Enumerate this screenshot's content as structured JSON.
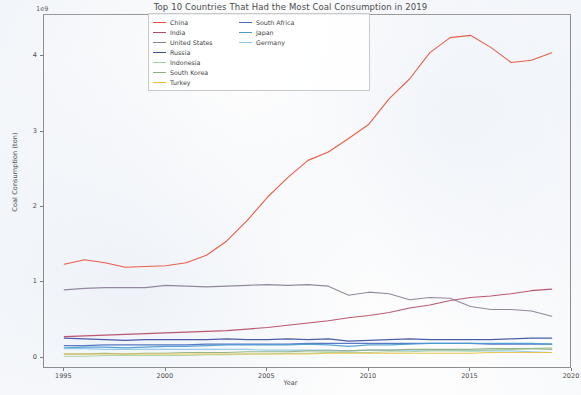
{
  "chart_data": {
    "type": "line",
    "title": "Top 10 Countries That Had the Most Coal Consumption in 2019",
    "xlabel": "Year",
    "ylabel": "Coal Consumption (ton)",
    "y_exponent_label": "1e9",
    "xlim": [
      1994,
      2020
    ],
    "ylim": [
      -0.15,
      4.55
    ],
    "xticks": [
      "1995",
      "2000",
      "2005",
      "2010",
      "2015",
      "2020"
    ],
    "xtick_values": [
      1995,
      2000,
      2005,
      2010,
      2015,
      2020
    ],
    "yticks": [
      "0",
      "1",
      "2",
      "3",
      "4"
    ],
    "ytick_values": [
      0,
      1,
      2,
      3,
      4
    ],
    "grid": false,
    "legend_position": "upper center",
    "x": [
      1995,
      1996,
      1997,
      1998,
      1999,
      2000,
      2001,
      2002,
      2003,
      2004,
      2005,
      2006,
      2007,
      2008,
      2009,
      2010,
      2011,
      2012,
      2013,
      2014,
      2015,
      2016,
      2017,
      2018,
      2019
    ],
    "series": [
      {
        "name": "China",
        "color": "#e8503a",
        "values": [
          1.24,
          1.3,
          1.26,
          1.2,
          1.21,
          1.22,
          1.26,
          1.36,
          1.55,
          1.82,
          2.13,
          2.39,
          2.62,
          2.73,
          2.91,
          3.1,
          3.44,
          3.7,
          4.05,
          4.25,
          4.28,
          4.12,
          3.92,
          3.95,
          4.05
        ]
      },
      {
        "name": "India",
        "color": "#b54a63",
        "values": [
          0.28,
          0.29,
          0.3,
          0.31,
          0.32,
          0.33,
          0.34,
          0.35,
          0.36,
          0.38,
          0.4,
          0.43,
          0.46,
          0.49,
          0.53,
          0.56,
          0.6,
          0.66,
          0.7,
          0.76,
          0.8,
          0.82,
          0.85,
          0.89,
          0.91
        ]
      },
      {
        "name": "United States",
        "color": "#8a7f96",
        "values": [
          0.9,
          0.92,
          0.93,
          0.93,
          0.93,
          0.96,
          0.95,
          0.94,
          0.95,
          0.96,
          0.97,
          0.96,
          0.97,
          0.95,
          0.83,
          0.87,
          0.85,
          0.77,
          0.8,
          0.79,
          0.68,
          0.64,
          0.64,
          0.62,
          0.55
        ]
      },
      {
        "name": "Russia",
        "color": "#3f4fa0",
        "values": [
          0.26,
          0.25,
          0.24,
          0.23,
          0.24,
          0.24,
          0.24,
          0.24,
          0.25,
          0.24,
          0.24,
          0.25,
          0.24,
          0.25,
          0.22,
          0.23,
          0.24,
          0.25,
          0.24,
          0.24,
          0.24,
          0.24,
          0.25,
          0.26,
          0.26
        ]
      },
      {
        "name": "South Africa",
        "color": "#4a6fc0",
        "values": [
          0.16,
          0.16,
          0.17,
          0.17,
          0.17,
          0.17,
          0.17,
          0.18,
          0.18,
          0.18,
          0.18,
          0.18,
          0.19,
          0.19,
          0.19,
          0.19,
          0.19,
          0.19,
          0.19,
          0.19,
          0.19,
          0.18,
          0.18,
          0.18,
          0.18
        ]
      },
      {
        "name": "Japan",
        "color": "#4a9bd4",
        "values": [
          0.13,
          0.14,
          0.14,
          0.13,
          0.14,
          0.15,
          0.15,
          0.16,
          0.17,
          0.17,
          0.17,
          0.17,
          0.18,
          0.17,
          0.15,
          0.17,
          0.17,
          0.18,
          0.19,
          0.19,
          0.19,
          0.19,
          0.19,
          0.19,
          0.18
        ]
      },
      {
        "name": "Germany",
        "color": "#8ec8e8",
        "values": [
          0.12,
          0.12,
          0.11,
          0.11,
          0.11,
          0.11,
          0.11,
          0.11,
          0.11,
          0.11,
          0.1,
          0.1,
          0.1,
          0.1,
          0.09,
          0.1,
          0.1,
          0.1,
          0.1,
          0.1,
          0.09,
          0.09,
          0.09,
          0.08,
          0.07
        ]
      },
      {
        "name": "Indonesia",
        "color": "#a8cfa0",
        "values": [
          0.02,
          0.02,
          0.03,
          0.03,
          0.03,
          0.03,
          0.03,
          0.04,
          0.04,
          0.05,
          0.05,
          0.06,
          0.06,
          0.07,
          0.07,
          0.07,
          0.08,
          0.08,
          0.09,
          0.09,
          0.09,
          0.1,
          0.11,
          0.12,
          0.13
        ]
      },
      {
        "name": "South Korea",
        "color": "#8fae84",
        "values": [
          0.05,
          0.05,
          0.06,
          0.05,
          0.06,
          0.06,
          0.07,
          0.07,
          0.07,
          0.08,
          0.08,
          0.08,
          0.09,
          0.09,
          0.09,
          0.1,
          0.1,
          0.11,
          0.11,
          0.11,
          0.11,
          0.12,
          0.12,
          0.12,
          0.11
        ]
      },
      {
        "name": "Turkey",
        "color": "#e8c23f",
        "values": [
          0.05,
          0.05,
          0.05,
          0.05,
          0.05,
          0.05,
          0.05,
          0.05,
          0.05,
          0.05,
          0.05,
          0.05,
          0.05,
          0.06,
          0.06,
          0.06,
          0.06,
          0.06,
          0.06,
          0.06,
          0.06,
          0.07,
          0.07,
          0.07,
          0.07
        ]
      }
    ],
    "legend_columns": [
      [
        "China",
        "India",
        "United States",
        "Russia"
      ],
      [
        "South Africa",
        "Japan",
        "Germany"
      ],
      [
        "Indonesia",
        "South Korea",
        "Turkey"
      ]
    ]
  }
}
